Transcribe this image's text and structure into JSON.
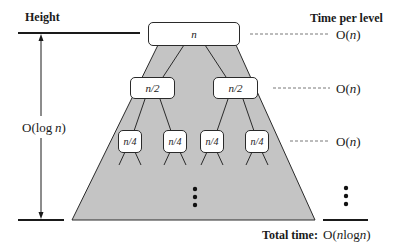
{
  "diagram": {
    "left_axis": {
      "heading": "Height",
      "height_label": "O(log n)",
      "height_label_parts": {
        "prefix": "O(",
        "func": "log",
        "var": "n",
        "suffix": ")"
      }
    },
    "right_column": {
      "heading": "Time per level",
      "levels": [
        {
          "label": "O(n)",
          "parts": {
            "prefix": "O(",
            "var": "n",
            "suffix": ")"
          }
        },
        {
          "label": "O(n)",
          "parts": {
            "prefix": "O(",
            "var": "n",
            "suffix": ")"
          }
        },
        {
          "label": "O(n)",
          "parts": {
            "prefix": "O(",
            "var": "n",
            "suffix": ")"
          }
        }
      ],
      "continuation": "vertical-ellipsis"
    },
    "total": {
      "label": "Total time:",
      "value": "O(n log n)",
      "value_parts": {
        "prefix": "O(",
        "var1": "n",
        "func": "log",
        "var2": "n",
        "suffix": ")"
      }
    },
    "tree": {
      "levels": [
        {
          "depth": 0,
          "nodes": [
            "n"
          ]
        },
        {
          "depth": 1,
          "nodes": [
            "n/2",
            "n/2"
          ]
        },
        {
          "depth": 2,
          "nodes": [
            "n/4",
            "n/4",
            "n/4",
            "n/4"
          ]
        }
      ],
      "continuation": "vertical-ellipsis"
    },
    "colors": {
      "triangle_fill": "#c4c4c4",
      "stroke": "#2a2a2a",
      "node_fill": "#ffffff",
      "text": "#1a1a1a"
    }
  }
}
